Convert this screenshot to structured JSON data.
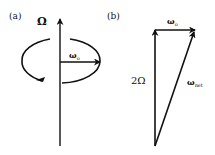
{
  "panel_a": {
    "label": "(a)",
    "axis_label": "Ω",
    "vector_label": {
      "base": "ω",
      "sub": "o"
    },
    "description": "Vertical rotation axis Ω with circular precession arrow and horizontal vector ω_o"
  },
  "panel_b": {
    "label": "(b)",
    "vertical_label": "2Ω",
    "top_label": {
      "base": "ω",
      "sub": "o"
    },
    "diagonal_label": {
      "base": "ω",
      "sub": "net"
    },
    "description": "Vector addition triangle: 2Ω (vertical) + ω_o (horizontal) = ω_net (diagonal)"
  },
  "colors": {
    "stroke": "#111111",
    "background": "#ffffff"
  }
}
